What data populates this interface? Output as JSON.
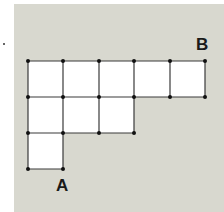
{
  "diagram": {
    "labels": {
      "start": "A",
      "end": "B"
    },
    "colors": {
      "background": "#d8d8cf",
      "cell_fill": "#ffffff",
      "line": "#3a3a3a",
      "node": "#111111",
      "label": "#1a1a1a"
    },
    "rows": [
      {
        "row": 1,
        "cells": 5
      },
      {
        "row": 2,
        "cells": 3
      },
      {
        "row": 3,
        "cells": 1
      }
    ],
    "total_cells": 9,
    "point_A": "bottom-right corner of the bottom-left cell",
    "point_B": "top-right corner of the top row"
  }
}
